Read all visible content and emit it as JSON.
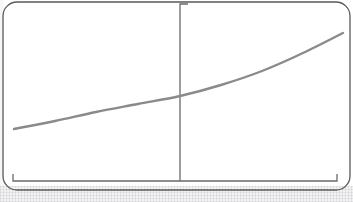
{
  "figure": {
    "kind": "scanned-line-chart-figure",
    "background_color": "#ffffff",
    "frame": {
      "name": "rounded-border-frame",
      "stroke_color": "#5a5a5e",
      "stroke_width": 1.3,
      "corner_radius": 14,
      "x": 3,
      "y": 2,
      "width": 347,
      "height": 188
    },
    "texture": {
      "band_color": "#f2f2f3",
      "band_top": 186,
      "band_height": 16
    }
  },
  "chart_data": {
    "type": "line",
    "title": "",
    "subtitle": "",
    "xlabel": "",
    "ylabel": "",
    "grid": false,
    "legend": false,
    "legend_position": "none",
    "axis_style": "bracket",
    "axes": {
      "x_axis": {
        "name": "horizontal-bracket-axis",
        "y_pixel": 181,
        "x_start_pixel": 13,
        "x_end_pixel": 337,
        "tick_style": "end-caps-up",
        "tick_height": 7,
        "stroke_color": "#6a6a6e",
        "stroke_width": 1.3,
        "tick_labels": []
      },
      "y_axis": {
        "name": "vertical-divider-axis",
        "x_pixel": 180,
        "y_top_pixel": 4,
        "y_bottom_pixel": 181,
        "tick_style": "top-cap-right",
        "tick_width": 8,
        "stroke_color": "#6a6a6e",
        "stroke_width": 1.3,
        "tick_labels": []
      }
    },
    "series": [
      {
        "name": "growth-curve",
        "style": "smooth-curve",
        "stroke_color": "#8a8a8e",
        "stroke_width": 2.4,
        "shape": "exponential-increasing",
        "x": [
          14,
          55,
          96,
          138,
          180,
          221,
          262,
          303,
          343
        ],
        "y": [
          129,
          121,
          112,
          104,
          96,
          85,
          71,
          53,
          33
        ],
        "points_pixel": [
          {
            "x": 14,
            "y": 129
          },
          {
            "x": 55,
            "y": 121
          },
          {
            "x": 96,
            "y": 112
          },
          {
            "x": 138,
            "y": 104
          },
          {
            "x": 180,
            "y": 96
          },
          {
            "x": 221,
            "y": 85
          },
          {
            "x": 262,
            "y": 71
          },
          {
            "x": 303,
            "y": 53
          },
          {
            "x": 343,
            "y": 33
          }
        ],
        "crossing_with_y_axis": {
          "x": 180,
          "y": 96
        }
      }
    ],
    "xlim": [
      13,
      337
    ],
    "ylim": [
      181,
      4
    ],
    "annotations": []
  }
}
